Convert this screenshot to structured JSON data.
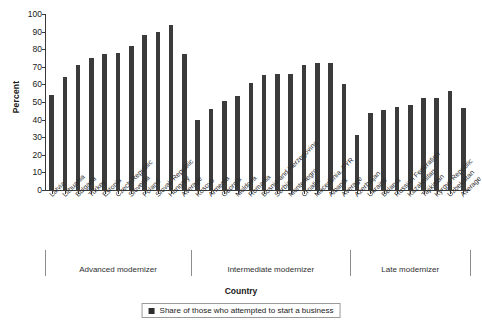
{
  "chart_data": {
    "type": "bar",
    "title": "",
    "xlabel": "Country",
    "ylabel": "Percent",
    "ylim": [
      0,
      100
    ],
    "ytick_step": 10,
    "yticks": [
      0,
      10,
      20,
      30,
      40,
      50,
      60,
      70,
      80,
      90,
      100
    ],
    "grid": false,
    "legend_position": "bottom",
    "series": [
      {
        "name": "Share of those who attempted to start a business",
        "color": "#3b3b3b",
        "values": [
          54,
          64,
          71,
          75,
          77,
          78,
          82,
          88,
          90,
          93.5,
          77,
          40,
          46,
          50.5,
          53.5,
          61,
          65.5,
          66,
          66,
          71,
          72,
          72,
          60,
          31,
          44,
          45.5,
          47,
          48.5,
          52,
          52.5,
          56.5,
          46.5
        ]
      }
    ],
    "categories": [
      "Latvia",
      "Lithuania",
      "Bulgaria",
      "Turkey",
      "Estonia",
      "Czech Republic",
      "Slovenia",
      "Poland",
      "Slovak Republic",
      "Hungary",
      "Average",
      "Kosovo",
      "Armenia",
      "Georgia",
      "Moldova",
      "Romania",
      "Bosnia and Herzegovina",
      "Serbia",
      "Montenegro",
      "Croatia",
      "Macedonia, FYR",
      "Albania",
      "Average",
      "Azerbaijan",
      "Ukraine",
      "Belarus",
      "Russian Federation",
      "Kazakhstan",
      "Tajikistan",
      "Kyrgyz Republic",
      "Uzbekistan",
      "Average"
    ],
    "groups": [
      {
        "label": "Advanced modernizer",
        "start": 0,
        "count": 11
      },
      {
        "label": "Intermediate modernizer",
        "start": 11,
        "count": 12
      },
      {
        "label": "Late modernizer",
        "start": 23,
        "count": 9
      }
    ]
  },
  "legend": {
    "items": [
      {
        "label": "Share of those who attempted to start a business",
        "color": "#2e2e2e"
      }
    ]
  }
}
